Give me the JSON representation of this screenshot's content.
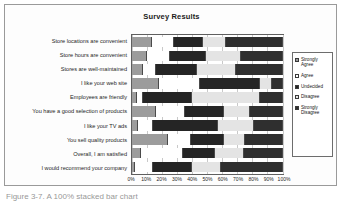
{
  "figure": {
    "caption": "Figure 3-7. A 100% stacked bar chart"
  },
  "chart_data": {
    "type": "bar",
    "subtype": "stacked-bar-100-horizontal",
    "title": "Survey Results",
    "xlabel": "",
    "ylabel": "",
    "xlim": [
      0,
      100
    ],
    "grid": true,
    "legend_position": "right",
    "orientation": "horizontal",
    "tick_labels": [
      "0%",
      "10%",
      "20%",
      "30%",
      "40%",
      "50%",
      "60%",
      "70%",
      "80%",
      "90%",
      "100%"
    ],
    "tick_values": [
      0,
      10,
      20,
      30,
      40,
      50,
      60,
      70,
      80,
      90,
      100
    ],
    "categories": [
      "Store locations are convenient",
      "Store hours are convenient",
      "Stores are well-maintained",
      "I like your web site",
      "Employees are friendly",
      "You have a good selection of products",
      "I like your TV ads",
      "You sell quality products",
      "Overall, I am satisfied",
      "I would recommend your company"
    ],
    "series": [
      {
        "name": "Strongly Agree",
        "color": "#9c9c9c",
        "values": [
          13,
          10,
          7,
          18,
          3,
          16,
          4,
          24,
          6,
          2
        ]
      },
      {
        "name": "Agree",
        "color": "#ffffff",
        "values": [
          15,
          15,
          9,
          27,
          4,
          19,
          10,
          15,
          28,
          12
        ]
      },
      {
        "name": "Undecided",
        "color": "#252525",
        "values": [
          19,
          24,
          27,
          40,
          33,
          26,
          43,
          22,
          21,
          26
        ]
      },
      {
        "name": "Disagree",
        "color": "#e4e4e4",
        "values": [
          15,
          23,
          26,
          8,
          45,
          17,
          24,
          14,
          19,
          19
        ]
      },
      {
        "name": "Strongly Disagree",
        "color": "#2f2f2f",
        "values": [
          38,
          28,
          31,
          7,
          15,
          22,
          19,
          25,
          26,
          41
        ]
      }
    ]
  }
}
